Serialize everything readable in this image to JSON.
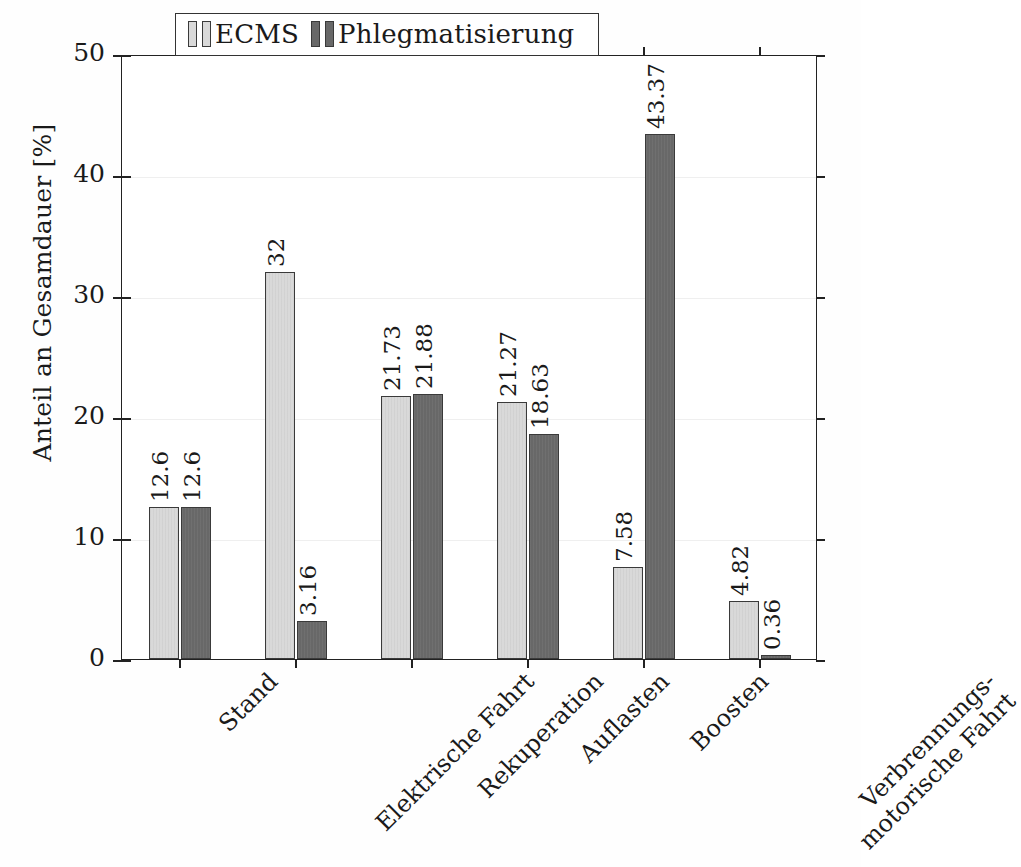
{
  "chart_data": {
    "type": "bar",
    "title": "",
    "xlabel": "",
    "ylabel": "Anteil an Gesamdauer [%]",
    "ylim": [
      0,
      50
    ],
    "yticks": [
      "0",
      "10",
      "20",
      "30",
      "40",
      "50"
    ],
    "ytick_values": [
      0,
      10,
      20,
      30,
      40,
      50
    ],
    "grid": false,
    "legend_position": "top-center",
    "categories": [
      "Stand",
      "Elektrische Fahrt",
      "Rekuperation",
      "Auflasten",
      "Boosten",
      "Verbrennungs-motorische Fahrt"
    ],
    "category_lines": [
      [
        "Stand",
        ""
      ],
      [
        "Elektrische Fahrt",
        ""
      ],
      [
        "Rekuperation",
        ""
      ],
      [
        "Auflasten",
        ""
      ],
      [
        "Boosten",
        ""
      ],
      [
        "Verbrennungs-",
        "motorische Fahrt"
      ]
    ],
    "series": [
      {
        "name": "ECMS",
        "color": "#d9d9d9",
        "values": [
          12.6,
          32,
          21.73,
          21.27,
          7.58,
          4.82
        ],
        "labels": [
          "12.6",
          "32",
          "21.73",
          "21.27",
          "7.58",
          "4.82"
        ]
      },
      {
        "name": "Phlegmatisierung",
        "color": "#686868",
        "values": [
          12.6,
          3.16,
          21.88,
          18.63,
          43.37,
          0.36
        ],
        "labels": [
          "12.6",
          "3.16",
          "21.88",
          "18.63",
          "43.37",
          "0.36"
        ]
      }
    ]
  },
  "legend": {
    "entries": [
      {
        "label": "ECMS"
      },
      {
        "label": "Phlegmatisierung"
      }
    ]
  },
  "axes": {
    "y_label": "Anteil an Gesamdauer [%]",
    "y_ticks": [
      "0",
      "10",
      "20",
      "30",
      "40",
      "50"
    ]
  },
  "colors": {
    "series_light": "#d9d9d9",
    "series_dark": "#686868",
    "frame": "#222222",
    "text": "#1a1a1a",
    "background": "#ffffff"
  }
}
